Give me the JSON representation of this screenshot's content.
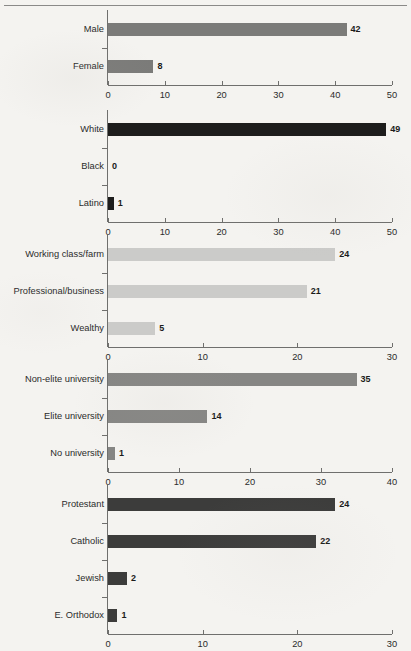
{
  "figure": {
    "background_color": "#f4f3f0",
    "rule_color": "#8a8a88",
    "axis_color": "#6f6f6d"
  },
  "chart_data": [
    {
      "type": "bar",
      "orientation": "horizontal",
      "panel_name": "gender",
      "title": "",
      "xlabel": "",
      "ylabel": "",
      "categories": [
        "Male",
        "Female"
      ],
      "values": [
        42,
        8
      ],
      "value_labels": [
        "42",
        "8"
      ],
      "xlim": [
        0,
        50
      ],
      "xticks": [
        0,
        10,
        20,
        30,
        40,
        50
      ],
      "xtick_labels": [
        "0",
        "10",
        "20",
        "30",
        "40",
        "50"
      ],
      "bar_color": "#7b7b79",
      "grid": false,
      "legend": "none"
    },
    {
      "type": "bar",
      "orientation": "horizontal",
      "panel_name": "race",
      "title": "",
      "xlabel": "",
      "ylabel": "",
      "categories": [
        "White",
        "Black",
        "Latino"
      ],
      "values": [
        49,
        0,
        1
      ],
      "value_labels": [
        "49",
        "0",
        "1"
      ],
      "xlim": [
        0,
        50
      ],
      "xticks": [
        0,
        10,
        20,
        30,
        40,
        50
      ],
      "xtick_labels": [
        "0",
        "10",
        "20",
        "30",
        "40",
        "50"
      ],
      "bar_color": "#1d1d1c",
      "grid": false,
      "legend": "none"
    },
    {
      "type": "bar",
      "orientation": "horizontal",
      "panel_name": "social-class",
      "title": "",
      "xlabel": "",
      "ylabel": "",
      "categories": [
        "Working class/farm",
        "Professional/business",
        "Wealthy"
      ],
      "values": [
        24,
        21,
        5
      ],
      "value_labels": [
        "24",
        "21",
        "5"
      ],
      "xlim": [
        0,
        30
      ],
      "xticks": [
        0,
        10,
        20,
        30
      ],
      "xtick_labels": [
        "0",
        "10",
        "20",
        "30"
      ],
      "bar_color": "#cbcbc9",
      "grid": false,
      "legend": "none"
    },
    {
      "type": "bar",
      "orientation": "horizontal",
      "panel_name": "education",
      "title": "",
      "xlabel": "",
      "ylabel": "",
      "categories": [
        "Non-elite university",
        "Elite university",
        "No university"
      ],
      "values": [
        35,
        14,
        1
      ],
      "value_labels": [
        "35",
        "14",
        "1"
      ],
      "xlim": [
        0,
        40
      ],
      "xticks": [
        0,
        10,
        20,
        30,
        40
      ],
      "xtick_labels": [
        "0",
        "10",
        "20",
        "30",
        "40"
      ],
      "bar_color": "#868684",
      "grid": false,
      "legend": "none"
    },
    {
      "type": "bar",
      "orientation": "horizontal",
      "panel_name": "religion",
      "title": "",
      "xlabel": "",
      "ylabel": "",
      "categories": [
        "Protestant",
        "Catholic",
        "Jewish",
        "E. Orthodox"
      ],
      "values": [
        24,
        22,
        2,
        1
      ],
      "value_labels": [
        "24",
        "22",
        "2",
        "1"
      ],
      "xlim": [
        0,
        30
      ],
      "xticks": [
        0,
        10,
        20,
        30
      ],
      "xtick_labels": [
        "0",
        "10",
        "20",
        "30"
      ],
      "bar_color": "#3c3c3b",
      "grid": false,
      "legend": "none"
    }
  ]
}
